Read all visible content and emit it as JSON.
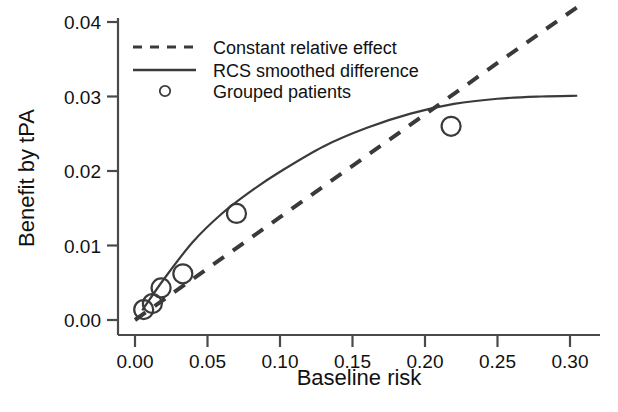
{
  "chart_data": {
    "type": "scatter",
    "title": "",
    "xlabel": "Baseline risk",
    "ylabel": "Benefit by tPA",
    "xlim": [
      0.0,
      0.31
    ],
    "ylim": [
      0.0,
      0.042
    ],
    "grid": false,
    "legend_position": "top-left",
    "xticks": [
      "0.00",
      "0.05",
      "0.10",
      "0.15",
      "0.20",
      "0.25",
      "0.30"
    ],
    "xtick_values": [
      0.0,
      0.05,
      0.1,
      0.15,
      0.2,
      0.25,
      0.3
    ],
    "yticks": [
      "0.00",
      "0.01",
      "0.02",
      "0.03",
      "0.04"
    ],
    "ytick_values": [
      0.0,
      0.01,
      0.02,
      0.03,
      0.04
    ],
    "series": [
      {
        "name": "Constant relative effect",
        "style": "dashed",
        "color": "#3a3a3a",
        "x": [
          0.0,
          0.05,
          0.1,
          0.15,
          0.2,
          0.25,
          0.305
        ],
        "values": [
          0.0,
          0.0069,
          0.0138,
          0.0207,
          0.0276,
          0.0345,
          0.042
        ]
      },
      {
        "name": "RCS smoothed difference",
        "style": "solid",
        "color": "#3a3a3a",
        "x": [
          0.005,
          0.02,
          0.04,
          0.06,
          0.08,
          0.1,
          0.13,
          0.16,
          0.19,
          0.22,
          0.25,
          0.28,
          0.305
        ],
        "values": [
          0.0013,
          0.0055,
          0.0105,
          0.0143,
          0.0173,
          0.0199,
          0.0233,
          0.0258,
          0.0277,
          0.029,
          0.0297,
          0.03,
          0.0301
        ]
      },
      {
        "name": "Grouped patients",
        "style": "circles",
        "color": "#3a3a3a",
        "x": [
          0.006,
          0.012,
          0.018,
          0.033,
          0.07,
          0.218
        ],
        "values": [
          0.0014,
          0.0022,
          0.0043,
          0.0062,
          0.0143,
          0.026
        ]
      }
    ]
  },
  "legend": {
    "items": [
      {
        "label": "Constant relative effect",
        "symbol": "dashed-line"
      },
      {
        "label": "RCS smoothed difference",
        "symbol": "solid-line"
      },
      {
        "label": "Grouped patients",
        "symbol": "open-circle"
      }
    ]
  },
  "axes": {
    "x_title": "Baseline risk",
    "y_title": "Benefit by tPA"
  }
}
